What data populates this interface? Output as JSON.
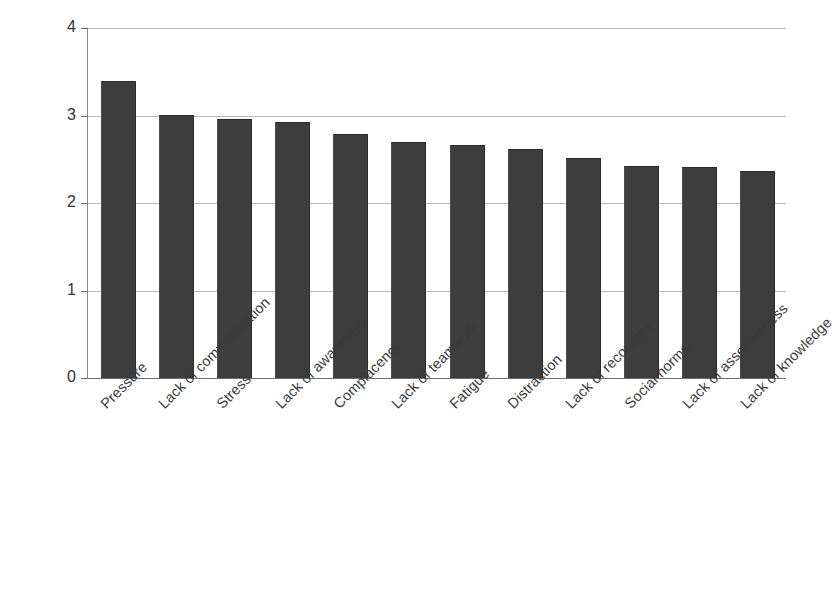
{
  "chart_data": {
    "type": "bar",
    "title": "",
    "subtitle": "",
    "xlabel": "",
    "ylabel": "",
    "ylim": [
      0,
      4
    ],
    "yticks": [
      0,
      1,
      2,
      3,
      4
    ],
    "ytick_labels": [
      "0",
      "1",
      "2",
      "3",
      "4"
    ],
    "grid": true,
    "grid_axis": "y",
    "legend": false,
    "legend_position": "none",
    "orientation": "vertical",
    "bar_color": "#3d3d3d",
    "background_color": "#ffffff",
    "gridline_color": "#b9b9b9",
    "axis_color": "#8a8a8a",
    "xtick_label_rotation": -45,
    "categories": [
      "Pressure",
      "Lack of communication",
      "Stress",
      "Lack of awareness",
      "Complacency",
      "Lack of teamwork",
      "Fatigue",
      "Distraction",
      "Lack of recources",
      "Social norms",
      "Lack of assertiveness",
      "Lack of knowledge"
    ],
    "values": [
      3.38,
      3.0,
      2.95,
      2.92,
      2.78,
      2.69,
      2.65,
      2.61,
      2.5,
      2.41,
      2.4,
      2.36
    ]
  },
  "axes": {
    "y_tick_labels": [
      "4",
      "3",
      "2",
      "1",
      "0"
    ]
  }
}
